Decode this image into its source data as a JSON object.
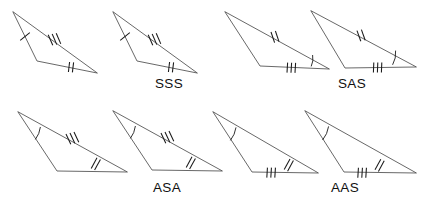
{
  "figure": {
    "title_text": "",
    "width": 427,
    "height": 202,
    "background_color": "#ffffff",
    "line_color": "#4d4d4d",
    "mark_color": "#1a1a1a",
    "label_color": "#111111"
  },
  "cases": [
    {
      "id": "sss",
      "label": "SSS",
      "label_x": 169,
      "label_y": 88,
      "description": "Side-Side-Side: all three corresponding sides marked congruent",
      "marks_summary": "1 tick left side, 3 ticks upper side, 2 ticks bottom side, no angle arcs",
      "triangles": [
        {
          "name": "sss-triangle-left",
          "points": "13,12 37,61 97,73",
          "sides": [
            {
              "name": "left-side",
              "ticks": 1,
              "p1": [
                13,
                12
              ],
              "p2": [
                37,
                61
              ]
            },
            {
              "name": "upper-side",
              "ticks": 3,
              "p1": [
                13,
                12
              ],
              "p2": [
                97,
                73
              ]
            },
            {
              "name": "bottom-side",
              "ticks": 2,
              "p1": [
                37,
                61
              ],
              "p2": [
                97,
                73
              ]
            }
          ],
          "angles": []
        },
        {
          "name": "sss-triangle-right",
          "points": "113,12 137,61 197,73",
          "sides": [
            {
              "name": "left-side",
              "ticks": 1,
              "p1": [
                113,
                12
              ],
              "p2": [
                137,
                61
              ]
            },
            {
              "name": "upper-side",
              "ticks": 3,
              "p1": [
                113,
                12
              ],
              "p2": [
                197,
                73
              ]
            },
            {
              "name": "bottom-side",
              "ticks": 2,
              "p1": [
                137,
                61
              ],
              "p2": [
                197,
                73
              ]
            }
          ],
          "angles": []
        }
      ]
    },
    {
      "id": "sas",
      "label": "SAS",
      "label_x": 352,
      "label_y": 88,
      "description": "Side-Angle-Side: two sides and the included angle marked congruent",
      "marks_summary": "2 ticks upper side, 3 ticks bottom side, single angle arc at bottom-right vertex",
      "triangles": [
        {
          "name": "sas-triangle-left",
          "points": "225,12 260,66 329,69",
          "sides": [
            {
              "name": "left-side",
              "ticks": 0,
              "p1": [
                225,
                12
              ],
              "p2": [
                260,
                66
              ]
            },
            {
              "name": "upper-side",
              "ticks": 2,
              "p1": [
                225,
                12
              ],
              "p2": [
                329,
                69
              ]
            },
            {
              "name": "bottom-side",
              "ticks": 3,
              "p1": [
                260,
                66
              ],
              "p2": [
                329,
                69
              ]
            }
          ],
          "angles": [
            {
              "name": "angle-bottom-right",
              "vertex": [
                329,
                69
              ],
              "arcs": 1
            }
          ]
        },
        {
          "name": "sas-triangle-right",
          "points": "311,11 345,68 416,67",
          "sides": [
            {
              "name": "left-side",
              "ticks": 0,
              "p1": [
                311,
                11
              ],
              "p2": [
                345,
                68
              ]
            },
            {
              "name": "upper-side",
              "ticks": 2,
              "p1": [
                311,
                11
              ],
              "p2": [
                416,
                67
              ]
            },
            {
              "name": "bottom-side",
              "ticks": 3,
              "p1": [
                345,
                68
              ],
              "p2": [
                416,
                67
              ]
            }
          ],
          "angles": [
            {
              "name": "angle-bottom-right",
              "vertex": [
                416,
                67
              ],
              "arcs": 1
            }
          ]
        }
      ]
    },
    {
      "id": "asa",
      "label": "ASA",
      "label_x": 167,
      "label_y": 192,
      "description": "Angle-Side-Angle: two angles and the included side marked congruent",
      "marks_summary": "single angle arc at apex, 3 ticks upper side, 2 ticks right side",
      "triangles": [
        {
          "name": "asa-triangle-left",
          "points": "18,112 57,171 127,172",
          "sides": [
            {
              "name": "left-side",
              "ticks": 0,
              "p1": [
                18,
                112
              ],
              "p2": [
                57,
                171
              ]
            },
            {
              "name": "upper-side",
              "ticks": 3,
              "p1": [
                18,
                112
              ],
              "p2": [
                127,
                172
              ]
            },
            {
              "name": "bottom-side",
              "ticks": 0,
              "p1": [
                57,
                171
              ],
              "p2": [
                127,
                172
              ]
            }
          ],
          "angles": [
            {
              "name": "angle-apex",
              "vertex": [
                18,
                112
              ],
              "arcs": 1
            }
          ],
          "double_ticks_on_upper_near_end": 2
        },
        {
          "name": "asa-triangle-right",
          "points": "113,111 152,170 222,171",
          "sides": [
            {
              "name": "left-side",
              "ticks": 0,
              "p1": [
                113,
                111
              ],
              "p2": [
                152,
                170
              ]
            },
            {
              "name": "upper-side",
              "ticks": 3,
              "p1": [
                113,
                111
              ],
              "p2": [
                222,
                171
              ]
            },
            {
              "name": "bottom-side",
              "ticks": 0,
              "p1": [
                152,
                170
              ],
              "p2": [
                222,
                171
              ]
            }
          ],
          "angles": [
            {
              "name": "angle-apex",
              "vertex": [
                113,
                111
              ],
              "arcs": 1
            }
          ],
          "double_ticks_on_upper_near_end": 2
        }
      ]
    },
    {
      "id": "aas",
      "label": "AAS",
      "label_x": 345,
      "label_y": 192,
      "description": "Angle-Angle-Side: two angles and a non-included side marked congruent",
      "marks_summary": "single angle arc at apex, 2 ticks right side, 3 ticks bottom side",
      "triangles": [
        {
          "name": "aas-triangle-left",
          "points": "213,112 252,172 318,173",
          "sides": [
            {
              "name": "left-side",
              "ticks": 0,
              "p1": [
                213,
                112
              ],
              "p2": [
                252,
                172
              ]
            },
            {
              "name": "upper-side",
              "ticks": 0,
              "p1": [
                213,
                112
              ],
              "p2": [
                318,
                173
              ]
            },
            {
              "name": "bottom-side",
              "ticks": 3,
              "p1": [
                252,
                172
              ],
              "p2": [
                318,
                173
              ]
            }
          ],
          "angles": [
            {
              "name": "angle-apex",
              "vertex": [
                213,
                112
              ],
              "arcs": 1
            }
          ],
          "double_ticks_on_upper_near_end": 2
        },
        {
          "name": "aas-triangle-right",
          "points": "305,111 344,172 416,173",
          "sides": [
            {
              "name": "left-side",
              "ticks": 0,
              "p1": [
                305,
                111
              ],
              "p2": [
                344,
                172
              ]
            },
            {
              "name": "upper-side",
              "ticks": 0,
              "p1": [
                305,
                111
              ],
              "p2": [
                416,
                173
              ]
            },
            {
              "name": "bottom-side",
              "ticks": 3,
              "p1": [
                344,
                172
              ],
              "p2": [
                416,
                173
              ]
            }
          ],
          "angles": [
            {
              "name": "angle-apex",
              "vertex": [
                305,
                111
              ],
              "arcs": 1
            }
          ],
          "double_ticks_on_upper_near_end": 2
        }
      ]
    }
  ]
}
